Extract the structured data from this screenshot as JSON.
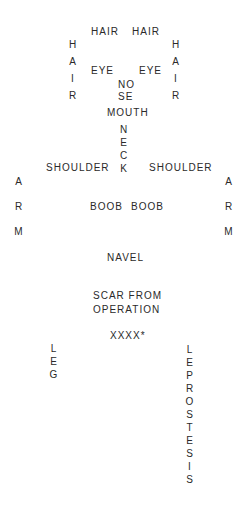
{
  "labels": {
    "hair_left": "HAIR",
    "hair_right": "HAIR",
    "eye_left": "EYE",
    "eye_right": "EYE",
    "nose_top": "NO",
    "nose_bottom": "SE",
    "mouth": "MOUTH",
    "shoulder_left": "SHOULDER",
    "shoulder_right": "SHOULDER",
    "boob_left": "BOOB",
    "boob_right": "BOOB",
    "navel": "NAVEL",
    "scar_line1": "SCAR FROM",
    "scar_line2": "OPERATION",
    "xxxx": "XXXX*"
  },
  "vertical": {
    "hair_side_left": [
      "H",
      "A",
      "I",
      "R"
    ],
    "hair_side_right": [
      "H",
      "A",
      "I",
      "R"
    ],
    "neck": [
      "N",
      "E",
      "C",
      "K"
    ],
    "arm_left": [
      "A",
      "R",
      "M"
    ],
    "arm_right": [
      "A",
      "R",
      "M"
    ],
    "leg": [
      "L",
      "E",
      "G"
    ],
    "leprostesis": [
      "L",
      "E",
      "P",
      "R",
      "O",
      "S",
      "T",
      "E",
      "S",
      "I",
      "S"
    ]
  }
}
